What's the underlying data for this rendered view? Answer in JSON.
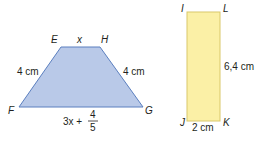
{
  "trapezoid": {
    "fill": "#b9c9e8",
    "stroke": "#5b7fbf",
    "vertices": {
      "E": "E",
      "H": "H",
      "F": "F",
      "G": "G"
    },
    "top_label": "x",
    "left_label": "4 cm",
    "right_label": "4 cm",
    "bottom_label_prefix": "3x +",
    "bottom_fraction_num": "4",
    "bottom_fraction_den": "5"
  },
  "rectangle": {
    "fill": "#fbf0a6",
    "stroke": "#d9c86a",
    "vertices": {
      "I": "I",
      "L": "L",
      "J": "J",
      "K": "K"
    },
    "right_label": "6,4 cm",
    "bottom_label": "2 cm"
  }
}
